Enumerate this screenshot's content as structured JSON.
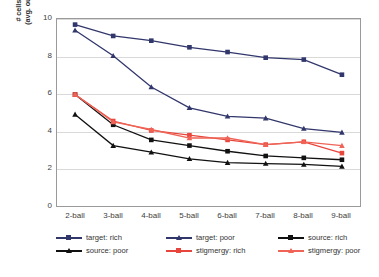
{
  "chart_data": {
    "type": "line",
    "title": "",
    "xlabel": "",
    "ylabel": "# cells alive, if alive\n(avg. out of 100 runs)",
    "categories": [
      "2-ball",
      "3-ball",
      "4-ball",
      "5-ball",
      "6-ball",
      "7-ball",
      "8-ball",
      "9-ball"
    ],
    "ylim": [
      0,
      10
    ],
    "yticks": [
      0,
      2,
      4,
      6,
      8,
      10
    ],
    "grid": true,
    "legend_position": "bottom",
    "series": [
      {
        "name": "target: rich",
        "color": "#31366b",
        "marker": "square",
        "values": [
          9.65,
          9.05,
          8.8,
          8.45,
          8.2,
          7.9,
          7.8,
          7.0
        ]
      },
      {
        "name": "target: poor",
        "color": "#31366b",
        "marker": "triangle",
        "values": [
          9.35,
          8.0,
          6.35,
          5.25,
          4.8,
          4.7,
          4.15,
          3.95
        ]
      },
      {
        "name": "source: rich",
        "color": "#111111",
        "marker": "square",
        "values": [
          5.95,
          4.35,
          3.55,
          3.25,
          2.95,
          2.7,
          2.6,
          2.5
        ]
      },
      {
        "name": "source: poor",
        "color": "#111111",
        "marker": "triangle",
        "values": [
          4.9,
          3.25,
          2.9,
          2.55,
          2.35,
          2.3,
          2.25,
          2.15
        ]
      },
      {
        "name": "stigmergy: rich",
        "color": "#e8453c",
        "marker": "square",
        "values": [
          5.95,
          4.55,
          4.05,
          3.8,
          3.55,
          3.3,
          3.45,
          2.85
        ]
      },
      {
        "name": "stigmergy: poor",
        "color": "#ef6457",
        "marker": "triangle",
        "values": [
          5.95,
          4.5,
          4.1,
          3.65,
          3.65,
          3.3,
          3.45,
          3.25
        ]
      }
    ]
  },
  "axes": {
    "y_tick_labels": [
      "10",
      "8",
      "6",
      "4",
      "2",
      "0"
    ],
    "x_tick_labels": [
      "2-ball",
      "3-ball",
      "4-ball",
      "5-ball",
      "6-ball",
      "7-ball",
      "8-ball",
      "9-ball"
    ],
    "y_axis_title": "# cells alive, if alive\n(avg. out of 100 runs)"
  },
  "legend": {
    "items": [
      {
        "label": "target: rich"
      },
      {
        "label": "target: poor"
      },
      {
        "label": "source: rich"
      },
      {
        "label": "source: poor"
      },
      {
        "label": "stigmergy: rich"
      },
      {
        "label": "stigmergy: poor"
      }
    ]
  },
  "colors": {
    "navy": "#31366b",
    "black": "#111111",
    "red": "#e8453c",
    "red_light": "#ef6457",
    "grid": "#d9d9d9",
    "frame": "#9a9a9a"
  }
}
